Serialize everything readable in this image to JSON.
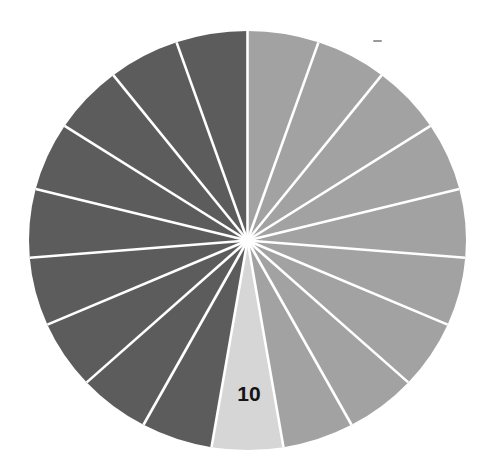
{
  "chart_data": {
    "type": "pie",
    "title": "",
    "slice_count": 19,
    "start_angle_deg": 0,
    "direction": "clockwise",
    "categories": [
      "1",
      "2",
      "3",
      "4",
      "5",
      "6",
      "7",
      "8",
      "9",
      "10",
      "11",
      "12",
      "13",
      "14",
      "15",
      "16",
      "17",
      "18",
      "19"
    ],
    "values": [
      1,
      1,
      1,
      1,
      1,
      1,
      1,
      1,
      1,
      1,
      1,
      1,
      1,
      1,
      1,
      1,
      1,
      1,
      1
    ],
    "slice_colors": [
      "#a2a2a2",
      "#a2a2a2",
      "#a2a2a2",
      "#a2a2a2",
      "#a2a2a2",
      "#a2a2a2",
      "#a2a2a2",
      "#a2a2a2",
      "#a2a2a2",
      "#d6d6d6",
      "#5c5c5c",
      "#5c5c5c",
      "#5c5c5c",
      "#5c5c5c",
      "#5c5c5c",
      "#5c5c5c",
      "#5c5c5c",
      "#5c5c5c",
      "#5c5c5c"
    ],
    "slice_labels": [
      "",
      "",
      "",
      "",
      "",
      "",
      "",
      "",
      "",
      "10",
      "",
      "",
      "",
      "",
      "",
      "",
      "",
      "",
      ""
    ],
    "separator_color": "#ffffff",
    "legend": "none",
    "grid": false
  },
  "colors": {
    "light_group": "#a2a2a2",
    "highlight": "#d6d6d6",
    "dark_group": "#5c5c5c",
    "label_text": "#141414"
  },
  "highlighted_label": "10"
}
